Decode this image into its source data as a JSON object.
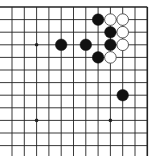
{
  "board": {
    "description": "Go board section (top-right corner view)",
    "columns": 12,
    "rows": 12,
    "origin_x": 12,
    "origin_y": 7,
    "spacing_x": 12.3,
    "spacing_y": 12.6,
    "edges": {
      "top": true,
      "right": true,
      "left": false,
      "bottom": false
    },
    "line_color": "#222222",
    "background": "#ffffff",
    "star_points": [
      {
        "col": 2,
        "row": 3
      },
      {
        "col": 2,
        "row": 9
      },
      {
        "col": 8,
        "row": 9
      }
    ],
    "stones": [
      {
        "color": "black",
        "col": 7,
        "row": 1
      },
      {
        "color": "white",
        "col": 8,
        "row": 1
      },
      {
        "color": "white",
        "col": 9,
        "row": 1
      },
      {
        "color": "black",
        "col": 8,
        "row": 2
      },
      {
        "color": "white",
        "col": 9,
        "row": 2
      },
      {
        "color": "black",
        "col": 4,
        "row": 3
      },
      {
        "color": "black",
        "col": 6,
        "row": 3
      },
      {
        "color": "black",
        "col": 8,
        "row": 3
      },
      {
        "color": "white",
        "col": 9,
        "row": 3
      },
      {
        "color": "black",
        "col": 7,
        "row": 4
      },
      {
        "color": "white",
        "col": 8,
        "row": 4
      },
      {
        "color": "black",
        "col": 9,
        "row": 7
      }
    ],
    "colors": {
      "black_stone": "#111111",
      "white_stone": "#ffffff",
      "white_stone_stroke": "#333333"
    }
  }
}
